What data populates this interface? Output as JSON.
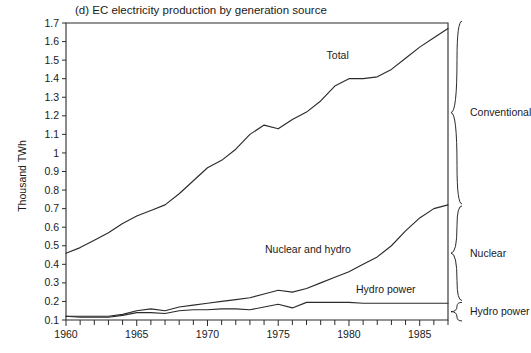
{
  "figure": {
    "panel_label": "(d)",
    "title": "EC electricity production by generation source"
  },
  "chart_data": {
    "type": "line",
    "title": "(d)  EC electricity production by generation source",
    "xlabel": "",
    "ylabel": "Thousand TWh",
    "xlim": [
      1960,
      1987
    ],
    "ylim": [
      0.1,
      1.7
    ],
    "grid": false,
    "legend_position": "inline-annotations-and-right-brackets",
    "x_ticks_major": [
      1960,
      1965,
      1970,
      1975,
      1980,
      1985
    ],
    "x_tick_labels": [
      "1960",
      "1965",
      "1970",
      "1975",
      "1980",
      "1985"
    ],
    "x_ticks_minor_step": 1,
    "y_ticks": [
      0.1,
      0.2,
      0.3,
      0.4,
      0.5,
      0.6,
      0.7,
      0.8,
      0.9,
      1.0,
      1.1,
      1.2,
      1.3,
      1.4,
      1.5,
      1.6,
      1.7
    ],
    "y_tick_labels": [
      "0.1",
      "0.2",
      "0.3",
      "0.4",
      "0.5",
      "0.6",
      "0.7",
      "0.8",
      "0.9",
      "1",
      "1.1",
      "1.2",
      "1.3",
      "1.4",
      "1.5",
      "1.6",
      "1.7"
    ],
    "x": [
      1960,
      1961,
      1962,
      1963,
      1964,
      1965,
      1966,
      1967,
      1968,
      1969,
      1970,
      1971,
      1972,
      1973,
      1974,
      1975,
      1976,
      1977,
      1978,
      1979,
      1980,
      1981,
      1982,
      1983,
      1984,
      1985,
      1986,
      1987
    ],
    "series": [
      {
        "name": "Total",
        "label": "Total",
        "values": [
          0.46,
          0.49,
          0.53,
          0.57,
          0.62,
          0.66,
          0.69,
          0.72,
          0.78,
          0.85,
          0.92,
          0.96,
          1.02,
          1.1,
          1.15,
          1.13,
          1.18,
          1.22,
          1.28,
          1.36,
          1.4,
          1.4,
          1.41,
          1.45,
          1.51,
          1.57,
          1.62,
          1.67
        ]
      },
      {
        "name": "Nuclear and hydro",
        "label": "Nuclear and hydro",
        "values": [
          0.12,
          0.12,
          0.12,
          0.12,
          0.13,
          0.15,
          0.16,
          0.15,
          0.17,
          0.18,
          0.19,
          0.2,
          0.21,
          0.22,
          0.24,
          0.26,
          0.25,
          0.27,
          0.3,
          0.33,
          0.36,
          0.4,
          0.44,
          0.5,
          0.58,
          0.65,
          0.7,
          0.72
        ]
      },
      {
        "name": "Hydro power",
        "label": "Hydro power",
        "values": [
          0.12,
          0.115,
          0.115,
          0.115,
          0.125,
          0.14,
          0.14,
          0.135,
          0.15,
          0.155,
          0.155,
          0.16,
          0.16,
          0.155,
          0.17,
          0.185,
          0.165,
          0.195,
          0.195,
          0.195,
          0.195,
          0.19,
          0.19,
          0.19,
          0.19,
          0.19,
          0.19,
          0.19
        ]
      }
    ],
    "annotations": [
      {
        "text": "Total",
        "x": 1979.2,
        "y": 1.505
      },
      {
        "text": "Nuclear and hydro",
        "x": 1977.1,
        "y": 0.46
      },
      {
        "text": "Hydro power",
        "x": 1982.6,
        "y": 0.245
      }
    ],
    "right_brackets": [
      {
        "label": "Conventional",
        "y_top": 1.71,
        "y_bottom": 0.725
      },
      {
        "label": "Nuclear",
        "y_top": 0.715,
        "y_bottom": 0.205
      },
      {
        "label": "Hydro power",
        "y_top": 0.195,
        "y_bottom": 0.095
      }
    ]
  },
  "colors": {
    "ink": "#2b2b2b",
    "background": "#ffffff"
  }
}
